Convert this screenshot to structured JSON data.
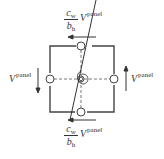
{
  "diagram": {
    "type": "panel-zone-shear-spring",
    "top_force": {
      "coef_num": "c",
      "coef_num_sub": "w",
      "coef_den": "b",
      "coef_den_sub": "h",
      "symbol": "V",
      "superscript": "panel",
      "arrow_direction": "left"
    },
    "bottom_force": {
      "coef_num": "c",
      "coef_num_sub": "w",
      "coef_den": "b",
      "coef_den_sub": "h",
      "symbol": "V",
      "superscript": "panel",
      "arrow_direction": "left"
    },
    "left_force": {
      "symbol": "V",
      "superscript": "panel",
      "arrow_direction": "down"
    },
    "right_force": {
      "symbol": "V",
      "superscript": "panel",
      "arrow_direction": "up"
    },
    "nodes": [
      "top",
      "right",
      "bottom",
      "left"
    ],
    "center_element": "rotational-spring",
    "colors": {
      "line": "#333333",
      "background": "#ffffff"
    }
  }
}
